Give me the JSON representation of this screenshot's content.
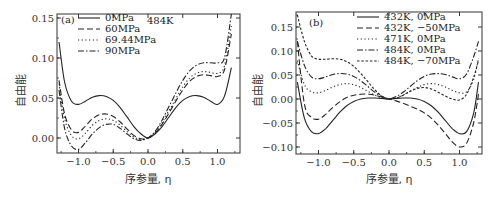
{
  "chart_data": [
    {
      "type": "line",
      "panel": "(a)",
      "annotation": "484K",
      "xlabel": "序参量, η",
      "ylabel": "自由能",
      "xlim": [
        -1.35,
        1.3
      ],
      "ylim": [
        -0.02,
        0.155
      ],
      "xticks": [
        "−1.0",
        "−0.5",
        "0.0",
        "0.5",
        "1.0"
      ],
      "yticks": [
        "0.00",
        "0.05",
        "0.10",
        "0.15"
      ],
      "legend_position": "upper left",
      "series": [
        {
          "name": "0MPa",
          "style": "solid",
          "x": [
            -1.28,
            -1.2,
            -1.1,
            -1.0,
            -0.9,
            -0.8,
            -0.7,
            -0.6,
            -0.5,
            -0.4,
            -0.3,
            -0.2,
            -0.1,
            0.0,
            0.1,
            0.2,
            0.3,
            0.4,
            0.5,
            0.6,
            0.7,
            0.8,
            0.9,
            1.0,
            1.1,
            1.2
          ],
          "y": [
            0.12,
            0.07,
            0.046,
            0.042,
            0.046,
            0.051,
            0.053,
            0.052,
            0.047,
            0.038,
            0.026,
            0.014,
            0.005,
            0.0,
            0.005,
            0.014,
            0.026,
            0.038,
            0.047,
            0.052,
            0.053,
            0.051,
            0.046,
            0.042,
            0.052,
            0.088
          ]
        },
        {
          "name": "60MPa",
          "style": "dashed",
          "x": [
            -1.28,
            -1.2,
            -1.1,
            -1.0,
            -0.9,
            -0.8,
            -0.7,
            -0.6,
            -0.5,
            -0.4,
            -0.3,
            -0.2,
            -0.1,
            0.0,
            0.1,
            0.2,
            0.3,
            0.4,
            0.5,
            0.6,
            0.7,
            0.8,
            0.9,
            1.0,
            1.1,
            1.2
          ],
          "y": [
            0.072,
            0.03,
            0.01,
            0.007,
            0.015,
            0.024,
            0.029,
            0.03,
            0.027,
            0.02,
            0.011,
            0.003,
            -0.001,
            0.0,
            0.006,
            0.017,
            0.031,
            0.046,
            0.06,
            0.071,
            0.077,
            0.079,
            0.078,
            0.077,
            0.085,
            0.13
          ]
        },
        {
          "name": "69.44MPa",
          "style": "dotted",
          "x": [
            -1.28,
            -1.2,
            -1.1,
            -1.0,
            -0.9,
            -0.8,
            -0.7,
            -0.6,
            -0.5,
            -0.4,
            -0.3,
            -0.2,
            -0.1,
            0.0,
            0.1,
            0.2,
            0.3,
            0.4,
            0.5,
            0.6,
            0.7,
            0.8,
            0.9,
            1.0,
            1.1,
            1.2
          ],
          "y": [
            0.068,
            0.024,
            0.003,
            -0.001,
            0.006,
            0.016,
            0.022,
            0.024,
            0.022,
            0.016,
            0.008,
            0.001,
            -0.002,
            0.0,
            0.007,
            0.019,
            0.034,
            0.049,
            0.064,
            0.075,
            0.081,
            0.083,
            0.082,
            0.081,
            0.09,
            0.14
          ]
        },
        {
          "name": "90MPa",
          "style": "dashdot",
          "x": [
            -1.28,
            -1.2,
            -1.1,
            -1.0,
            -0.9,
            -0.8,
            -0.7,
            -0.6,
            -0.5,
            -0.4,
            -0.3,
            -0.2,
            -0.1,
            0.0,
            0.1,
            0.2,
            0.3,
            0.4,
            0.5,
            0.6,
            0.7,
            0.8,
            0.9,
            1.0,
            1.1,
            1.2
          ],
          "y": [
            0.06,
            0.012,
            -0.01,
            -0.014,
            -0.006,
            0.005,
            0.013,
            0.017,
            0.017,
            0.012,
            0.005,
            -0.001,
            -0.003,
            0.0,
            0.008,
            0.022,
            0.039,
            0.056,
            0.072,
            0.084,
            0.091,
            0.094,
            0.094,
            0.094,
            0.1,
            0.155
          ]
        }
      ]
    },
    {
      "type": "line",
      "panel": "(b)",
      "xlabel": "序参量, η",
      "ylabel": "自由能",
      "xlim": [
        -1.35,
        1.3
      ],
      "ylim": [
        -0.115,
        0.18
      ],
      "xticks": [
        "−1.0",
        "−0.5",
        "0.0",
        "0.5",
        "1.0"
      ],
      "yticks": [
        "−0.10",
        "−0.05",
        "0.00",
        "0.05",
        "0.10",
        "0.15"
      ],
      "legend_position": "upper right",
      "series": [
        {
          "name": "432K, 0MPa",
          "style": "solid",
          "x": [
            -1.3,
            -1.2,
            -1.1,
            -1.0,
            -0.9,
            -0.8,
            -0.7,
            -0.6,
            -0.5,
            -0.4,
            -0.3,
            -0.2,
            -0.1,
            0.0,
            0.1,
            0.2,
            0.3,
            0.4,
            0.5,
            0.6,
            0.7,
            0.8,
            0.9,
            1.0,
            1.1,
            1.2,
            1.27
          ],
          "y": [
            0.035,
            -0.04,
            -0.068,
            -0.072,
            -0.062,
            -0.045,
            -0.028,
            -0.014,
            -0.005,
            0.0,
            0.002,
            0.002,
            0.001,
            0.0,
            0.001,
            0.002,
            0.002,
            0.0,
            -0.005,
            -0.014,
            -0.028,
            -0.045,
            -0.062,
            -0.072,
            -0.068,
            -0.03,
            0.035
          ]
        },
        {
          "name": "432K, −50MPa",
          "style": "dashed",
          "x": [
            -1.3,
            -1.2,
            -1.1,
            -1.0,
            -0.9,
            -0.8,
            -0.7,
            -0.6,
            -0.5,
            -0.4,
            -0.3,
            -0.2,
            -0.1,
            0.0,
            0.1,
            0.2,
            0.3,
            0.4,
            0.5,
            0.6,
            0.7,
            0.8,
            0.9,
            1.0,
            1.1,
            1.2,
            1.27
          ],
          "y": [
            0.12,
            -0.01,
            -0.038,
            -0.042,
            -0.032,
            -0.018,
            -0.006,
            0.003,
            0.008,
            0.01,
            0.01,
            0.008,
            0.004,
            0.0,
            -0.004,
            -0.009,
            -0.015,
            -0.021,
            -0.029,
            -0.04,
            -0.055,
            -0.072,
            -0.09,
            -0.1,
            -0.092,
            -0.05,
            0.01
          ]
        },
        {
          "name": "471K, 0MPa",
          "style": "dotted",
          "x": [
            -1.3,
            -1.2,
            -1.1,
            -1.0,
            -0.9,
            -0.8,
            -0.7,
            -0.6,
            -0.5,
            -0.4,
            -0.3,
            -0.2,
            -0.1,
            0.0,
            0.1,
            0.2,
            0.3,
            0.4,
            0.5,
            0.6,
            0.7,
            0.8,
            0.9,
            1.0,
            1.1,
            1.2,
            1.27
          ],
          "y": [
            0.08,
            0.03,
            0.015,
            0.013,
            0.018,
            0.025,
            0.03,
            0.032,
            0.03,
            0.024,
            0.016,
            0.008,
            0.002,
            0.0,
            0.002,
            0.008,
            0.016,
            0.024,
            0.03,
            0.032,
            0.03,
            0.025,
            0.018,
            0.013,
            0.015,
            0.04,
            0.085
          ]
        },
        {
          "name": "484K, 0MPa",
          "style": "dashdot",
          "x": [
            -1.3,
            -1.2,
            -1.1,
            -1.0,
            -0.9,
            -0.8,
            -0.7,
            -0.6,
            -0.5,
            -0.4,
            -0.3,
            -0.2,
            -0.1,
            0.0,
            0.1,
            0.2,
            0.3,
            0.4,
            0.5,
            0.6,
            0.7,
            0.8,
            0.9,
            1.0,
            1.1,
            1.2,
            1.27
          ],
          "y": [
            0.12,
            0.07,
            0.046,
            0.042,
            0.046,
            0.051,
            0.053,
            0.052,
            0.047,
            0.038,
            0.026,
            0.014,
            0.005,
            0.0,
            0.005,
            0.014,
            0.026,
            0.038,
            0.047,
            0.052,
            0.053,
            0.051,
            0.046,
            0.042,
            0.052,
            0.088,
            0.12
          ]
        },
        {
          "name": "484K, −70MPa",
          "style": "shortdash",
          "x": [
            -1.3,
            -1.2,
            -1.1,
            -1.0,
            -0.9,
            -0.8,
            -0.7,
            -0.6,
            -0.5,
            -0.4,
            -0.3,
            -0.2,
            -0.1,
            0.0,
            0.1,
            0.2,
            0.3,
            0.4,
            0.5,
            0.6,
            0.7,
            0.8,
            0.9,
            1.0,
            1.1,
            1.2,
            1.27
          ],
          "y": [
            0.175,
            0.12,
            0.09,
            0.083,
            0.083,
            0.084,
            0.083,
            0.078,
            0.068,
            0.053,
            0.036,
            0.019,
            0.006,
            0.0,
            0.002,
            0.008,
            0.016,
            0.022,
            0.024,
            0.021,
            0.014,
            0.006,
            0.0,
            -0.002,
            0.01,
            0.045,
            0.08
          ]
        }
      ]
    }
  ]
}
